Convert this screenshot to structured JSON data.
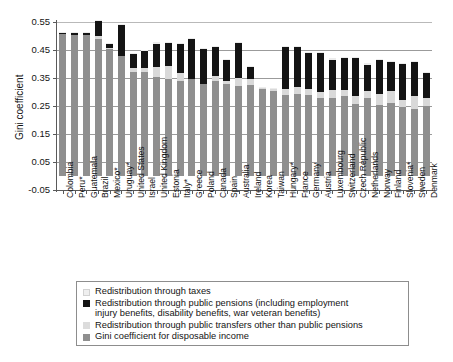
{
  "chart_data": {
    "type": "bar",
    "title": "",
    "subtitle": "",
    "xlabel": "",
    "ylabel": "Gini coefficient",
    "ylim": [
      -0.05,
      0.55
    ],
    "ytick_labels": [
      "0.55",
      "0.45",
      "0.35",
      "0.25",
      "0.15",
      "0.05",
      "-0.05"
    ],
    "ytick_values": [
      0.55,
      0.45,
      0.35,
      0.25,
      0.15,
      0.05,
      -0.05
    ],
    "grid": true,
    "stacked": true,
    "legend_position": "bottom",
    "categories": [
      "Colombia",
      "Peru*",
      "Guatemala",
      "Brazil",
      "Mexico*",
      "Uruguay*",
      "United States",
      "Israel",
      "United Kingdom",
      "Estonia",
      "Italy*",
      "Greece",
      "Poland",
      "Canada",
      "Spain",
      "Australia",
      "Ireland",
      "Korea",
      "Taiwan",
      "Hungary*",
      "France",
      "Germany",
      "Austria",
      "Luxembourg",
      "Switzerland",
      "Czech Republic",
      "Netherlands",
      "Norway",
      "Finland",
      "Slovenia*",
      "Sweden",
      "Denmark"
    ],
    "series": [
      {
        "name": "Gini coefficient for disposable income",
        "key": "disposable",
        "color": "#8f8f8f",
        "values": [
          0.508,
          0.505,
          0.505,
          0.49,
          0.452,
          0.428,
          0.372,
          0.372,
          0.355,
          0.348,
          0.34,
          0.345,
          0.33,
          0.338,
          0.33,
          0.32,
          0.325,
          0.31,
          0.305,
          0.29,
          0.293,
          0.29,
          0.28,
          0.278,
          0.285,
          0.258,
          0.278,
          0.252,
          0.262,
          0.245,
          0.24,
          0.25
        ]
      },
      {
        "name": "Redistribution through public transfers other than public pensions",
        "key": "transfers",
        "color": "#d9d9d9",
        "values": [
          0.0,
          0.0,
          0.0,
          0.01,
          0.004,
          0.0,
          0.015,
          0.012,
          0.036,
          0.046,
          0.028,
          0.0,
          0.0,
          0.02,
          0.01,
          0.03,
          0.022,
          0.004,
          0.006,
          0.022,
          0.026,
          0.022,
          0.02,
          0.03,
          0.022,
          0.028,
          0.026,
          0.04,
          0.04,
          0.026,
          0.044,
          0.03
        ]
      },
      {
        "name": "Redistribution through public pensions (including employment injury benefits, disability benefits, war veteran benefits)",
        "key": "pensions",
        "color": "#141414",
        "values": [
          0.004,
          0.004,
          0.006,
          0.052,
          0.016,
          0.112,
          0.05,
          0.062,
          0.082,
          0.082,
          0.102,
          0.143,
          0.124,
          0.102,
          0.073,
          0.126,
          0.043,
          0.0,
          0.0,
          0.148,
          0.14,
          0.128,
          0.138,
          0.108,
          0.114,
          0.134,
          0.094,
          0.122,
          0.104,
          0.13,
          0.124,
          0.088
        ]
      },
      {
        "name": "Redistribution through taxes",
        "key": "taxes",
        "color": "#ececec",
        "values": [
          0.004,
          0.004,
          0.004,
          0.004,
          0.004,
          0.004,
          0.004,
          0.004,
          0.004,
          0.004,
          0.004,
          0.004,
          0.004,
          0.004,
          0.004,
          0.004,
          0.004,
          0.004,
          0.004,
          0.004,
          0.004,
          0.004,
          0.004,
          0.004,
          0.004,
          0.004,
          0.004,
          0.004,
          0.004,
          0.004,
          0.004,
          0.004
        ]
      }
    ],
    "legend_entries": [
      {
        "label": "Redistribution through taxes",
        "swatch": "#efefef"
      },
      {
        "label": "Redistribution through public pensions (including employment injury benefits, disability benefits, war veteran benefits)",
        "swatch": "#141414"
      },
      {
        "label": "Redistribution through public transfers other than public pensions",
        "swatch": "#dcdcdc"
      },
      {
        "label": "Gini coefficient for disposable income",
        "swatch": "#8f8f8f"
      }
    ]
  },
  "legend": {
    "taxes_label": "Redistribution through taxes",
    "pensions_label_line1": "Redistribution through public pensions (including employment",
    "pensions_label_line2": "injury benefits, disability benefits, war veteran benefits)",
    "transfers_label": "Redistribution through public transfers other than public pensions",
    "disposable_label": "Gini coefficient for disposable income"
  },
  "axes": {
    "y_title": "Gini coefficient"
  }
}
